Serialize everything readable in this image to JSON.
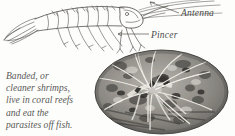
{
  "figure": {
    "kind": "encyclopedia-figure",
    "background_color": "#fdfdfc",
    "ink_color": "#4a4a48"
  },
  "labels": [
    {
      "id": "antenna",
      "text": "Antenna"
    },
    {
      "id": "pincer",
      "text": "Pincer"
    }
  ],
  "caption": {
    "lines": [
      "Banded, or",
      "cleaner shrimps,",
      "live in coral reefs",
      "and eat the",
      "parasites off fish."
    ],
    "full_text": "Banded, or cleaner shrimps, live in coral reefs and eat the parasites off fish."
  },
  "illustration": {
    "name": "shrimp-line-drawing",
    "description": "pen-and-ink side view of a shrimp facing right with tail fan at left, segmented body, walking legs and long antennae"
  },
  "photograph": {
    "name": "banded-shrimp-photo",
    "shape": "oval",
    "palette": "grayscale",
    "description": "oval-cropped grayscale photo of a banded cleaner shrimp with long pale antennae on reef rubble"
  }
}
